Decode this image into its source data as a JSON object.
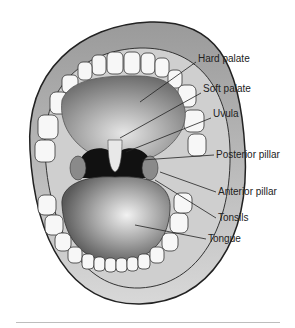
{
  "diagram": {
    "labels": [
      {
        "id": "hard-palate",
        "text": "Hard palate",
        "x": 198,
        "y": 59
      },
      {
        "id": "soft-palate",
        "text": "Soft palate",
        "x": 203,
        "y": 89
      },
      {
        "id": "uvula",
        "text": "Uvula",
        "x": 213,
        "y": 114
      },
      {
        "id": "posterior-pillar",
        "text": "Posterior pillar",
        "x": 216,
        "y": 150
      },
      {
        "id": "anterior-pillar",
        "text": "Anterior pillar",
        "x": 218,
        "y": 188
      },
      {
        "id": "tonsils",
        "text": "Tonsils",
        "x": 218,
        "y": 214
      },
      {
        "id": "tongue",
        "text": "Tongue",
        "x": 208,
        "y": 235
      }
    ]
  }
}
